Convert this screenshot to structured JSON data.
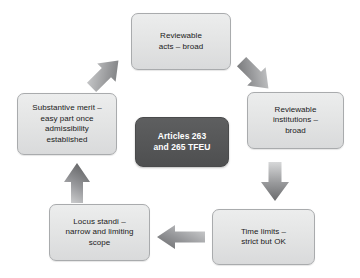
{
  "diagram": {
    "center": {
      "id": "center",
      "label": "Articles 263\nand 265 TFEU",
      "fill": "#565758",
      "text_color": "#ffffff"
    },
    "node_fill": "#e4e5e5",
    "node_border": "#a9abad",
    "node_text_color": "#1a1a1a",
    "arrow_color": "#8c8d8f",
    "nodes": [
      {
        "id": "reviewable-acts",
        "label": "Reviewable\nacts – broad",
        "position": "top"
      },
      {
        "id": "reviewable-institutions",
        "label": "Reviewable\ninstitutions –\nbroad",
        "position": "right"
      },
      {
        "id": "time-limits",
        "label": "Time limits –\nstrict but OK",
        "position": "bottom-right"
      },
      {
        "id": "locus-standi",
        "label": "Locus standi –\nnarrow and limiting\nscope",
        "position": "bottom-left"
      },
      {
        "id": "substantive-merit",
        "label": "Substantive merit –\neasy part once\nadmissibility\nestablished",
        "position": "left"
      }
    ],
    "arrows": [
      {
        "id": "arrow-top-left",
        "from": "substantive-merit",
        "to": "reviewable-acts",
        "direction": "up-right",
        "icon": "arrow-up-right-icon"
      },
      {
        "id": "arrow-top-right",
        "from": "reviewable-acts",
        "to": "reviewable-institutions",
        "direction": "down-right",
        "icon": "arrow-down-right-icon"
      },
      {
        "id": "arrow-right",
        "from": "reviewable-institutions",
        "to": "time-limits",
        "direction": "down",
        "icon": "arrow-down-icon"
      },
      {
        "id": "arrow-bottom",
        "from": "time-limits",
        "to": "locus-standi",
        "direction": "left",
        "icon": "arrow-left-icon"
      },
      {
        "id": "arrow-left",
        "from": "locus-standi",
        "to": "substantive-merit",
        "direction": "up",
        "icon": "arrow-up-icon"
      }
    ]
  }
}
